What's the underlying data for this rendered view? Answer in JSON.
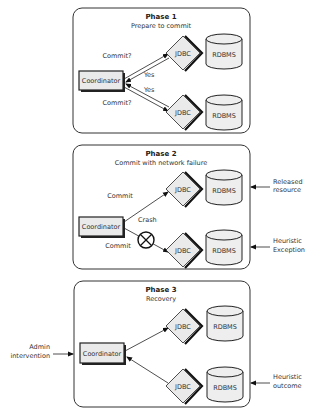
{
  "phases": [
    {
      "title": "Phase 1",
      "subtitle": "Prepare to commit",
      "coordinator": "Coordinator",
      "jdbc": [
        "JDBC",
        "JDBC"
      ],
      "rdbms": [
        "RDBMS",
        "RDBMS"
      ],
      "edge_labels": {
        "commit_top": "Commit?",
        "yes_top": "Yes",
        "yes_bottom": "Yes",
        "commit_bottom": "Commit?"
      }
    },
    {
      "title": "Phase 2",
      "subtitle": "Commit with network failure",
      "coordinator": "Coordinator",
      "jdbc": [
        "JDBC",
        "JDBC"
      ],
      "rdbms": [
        "RDBMS",
        "RDBMS"
      ],
      "edge_labels": {
        "commit_top": "Commit",
        "crash": "Crash",
        "commit_bottom": "Commit"
      },
      "side_labels": {
        "top": [
          "Released",
          "resource"
        ],
        "bottom": [
          "Heuristic",
          "Exception"
        ]
      }
    },
    {
      "title": "Phase 3",
      "subtitle": "Recovery",
      "coordinator": "Coordinator",
      "jdbc": [
        "JDBC",
        "JDBC"
      ],
      "rdbms": [
        "RDBMS",
        "RDBMS"
      ],
      "left_label": [
        "Admin",
        "intervention"
      ],
      "side_labels": {
        "bottom": [
          "Heuristic",
          "outcome"
        ]
      }
    }
  ]
}
